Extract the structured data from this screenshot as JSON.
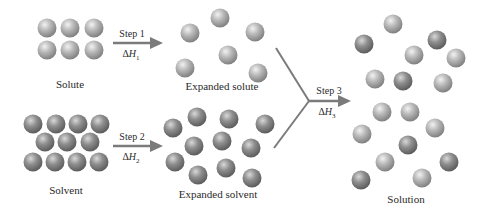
{
  "diagram": {
    "colors": {
      "background": "#ffffff",
      "arrow": "#7b7b7b",
      "sphere_light": "#b4b4b4",
      "sphere_dark": "#8a8a8a",
      "text": "#2a2a2a"
    },
    "labels": {
      "solute": "Solute",
      "expanded_solute": "Expanded solute",
      "solvent": "Solvent",
      "expanded_solvent": "Expanded solvent",
      "solution": "Solution"
    },
    "steps": [
      {
        "label": "Step 1",
        "delta_symbol": "Δ",
        "var": "H",
        "sub": "1"
      },
      {
        "label": "Step 2",
        "delta_symbol": "Δ",
        "var": "H",
        "sub": "2"
      },
      {
        "label": "Step 3",
        "delta_symbol": "Δ",
        "var": "H",
        "sub": "3"
      }
    ],
    "groups": {
      "solute": [
        [
          47,
          28,
          "l"
        ],
        [
          70,
          28,
          "l"
        ],
        [
          94,
          28,
          "l"
        ],
        [
          47,
          50,
          "l"
        ],
        [
          70,
          50,
          "l"
        ],
        [
          94,
          50,
          "l"
        ]
      ],
      "expanded_solute": [
        [
          220,
          18,
          "l"
        ],
        [
          190,
          33,
          "l"
        ],
        [
          255,
          32,
          "l"
        ],
        [
          228,
          55,
          "l"
        ],
        [
          185,
          68,
          "l"
        ],
        [
          258,
          73,
          "l"
        ]
      ],
      "solvent": [
        [
          33,
          124,
          "d"
        ],
        [
          56,
          124,
          "d"
        ],
        [
          78,
          124,
          "d"
        ],
        [
          100,
          124,
          "d"
        ],
        [
          45,
          142,
          "d"
        ],
        [
          67,
          142,
          "d"
        ],
        [
          90,
          142,
          "d"
        ],
        [
          33,
          162,
          "d"
        ],
        [
          55,
          162,
          "d"
        ],
        [
          77,
          162,
          "d"
        ],
        [
          99,
          162,
          "d"
        ]
      ],
      "expanded_solvent": [
        [
          173,
          128,
          "d"
        ],
        [
          197,
          117,
          "d"
        ],
        [
          229,
          119,
          "d"
        ],
        [
          265,
          124,
          "d"
        ],
        [
          194,
          146,
          "d"
        ],
        [
          222,
          141,
          "d"
        ],
        [
          251,
          148,
          "d"
        ],
        [
          175,
          162,
          "d"
        ],
        [
          198,
          175,
          "d"
        ],
        [
          226,
          168,
          "d"
        ],
        [
          252,
          178,
          "d"
        ]
      ],
      "solution": [
        [
          393,
          24,
          "l"
        ],
        [
          364,
          44,
          "d"
        ],
        [
          437,
          40,
          "d"
        ],
        [
          414,
          55,
          "l"
        ],
        [
          456,
          58,
          "l"
        ],
        [
          375,
          79,
          "l"
        ],
        [
          403,
          81,
          "d"
        ],
        [
          443,
          83,
          "l"
        ],
        [
          382,
          112,
          "l"
        ],
        [
          410,
          112,
          "l"
        ],
        [
          435,
          128,
          "l"
        ],
        [
          362,
          134,
          "l"
        ],
        [
          408,
          145,
          "d"
        ],
        [
          385,
          162,
          "l"
        ],
        [
          449,
          162,
          "d"
        ],
        [
          361,
          180,
          "d"
        ],
        [
          422,
          178,
          "l"
        ]
      ]
    }
  }
}
